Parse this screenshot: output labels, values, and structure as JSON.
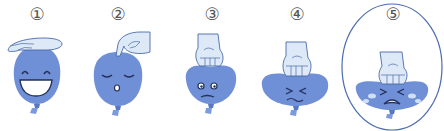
{
  "figure": {
    "colors": {
      "balloon": "#6f8fd6",
      "balloon_dark": "#5a78c2",
      "hand": "#dde9f7",
      "hand_outline": "#4a6aa8",
      "face_line": "#23305a",
      "tear": "#cfe0f5",
      "ellipse": "#4b6bb0"
    },
    "stages": [
      {
        "label": "①",
        "x": 37,
        "face": "laughing",
        "hand": "flat palm resting on top"
      },
      {
        "label": "②",
        "x": 118,
        "face": "calm eyes closed, small o mouth",
        "hand": "fingertips pressing"
      },
      {
        "label": "③",
        "x": 211,
        "face": "worried",
        "hand": "fist pressing down"
      },
      {
        "label": "④",
        "x": 296,
        "face": "strained",
        "hand": "fist pushing harder"
      },
      {
        "label": "⑤",
        "x": 392,
        "face": "crying",
        "hand": "fist squashing flat",
        "highlighted": true
      }
    ]
  }
}
